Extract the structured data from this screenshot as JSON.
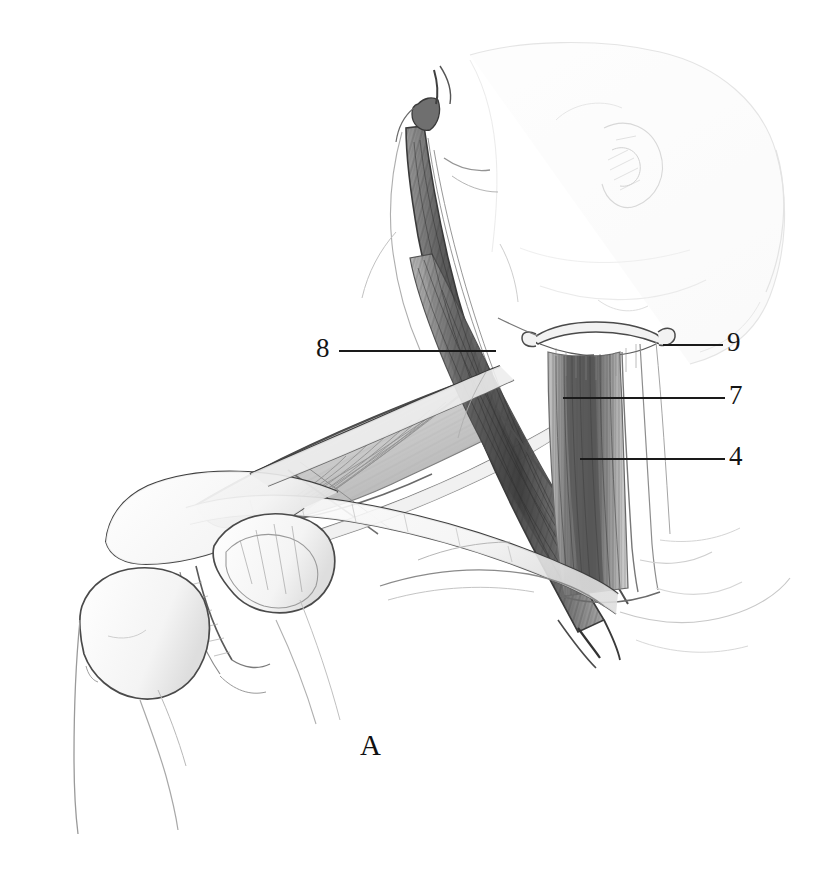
{
  "figure": {
    "panel_letter": "A",
    "background_color": "#ffffff",
    "ink_color": "#1a1a1a",
    "shading_color": "#6e6e6e"
  },
  "labels": [
    {
      "id": "label-8",
      "text": "8",
      "x": 316,
      "y": 335,
      "side": "left",
      "leader": {
        "x": 339,
        "y": 350,
        "width": 157
      }
    },
    {
      "id": "label-9",
      "text": "9",
      "x": 727,
      "y": 329,
      "side": "right",
      "leader": {
        "x": 663,
        "y": 344,
        "width": 60
      }
    },
    {
      "id": "label-7",
      "text": "7",
      "x": 729,
      "y": 382,
      "side": "right",
      "leader": {
        "x": 563,
        "y": 397,
        "width": 162
      }
    },
    {
      "id": "label-4",
      "text": "4",
      "x": 729,
      "y": 443,
      "side": "right",
      "leader": {
        "x": 580,
        "y": 458,
        "width": 145
      }
    }
  ]
}
